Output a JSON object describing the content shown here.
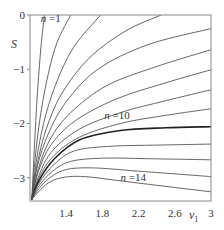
{
  "chart_data": {
    "type": "line",
    "title": "",
    "xlabel": "v1",
    "xlabel_main": "v",
    "xlabel_sub": "1",
    "ylabel": "S",
    "xlim": [
      1.0,
      3.0
    ],
    "ylim": [
      -3.43,
      0
    ],
    "grid": false,
    "legend": "none",
    "x_ticks": [
      1.4,
      1.8,
      2.2,
      2.6,
      3
    ],
    "x_tick_labels": [
      "1.4",
      "1.8",
      "2.2",
      "2.6",
      "3"
    ],
    "y_ticks": [
      0,
      -1,
      -2,
      -3
    ],
    "y_tick_labels": [
      "0",
      "−1",
      "−2",
      "−3"
    ],
    "annotations": [
      {
        "text_n": "n",
        "text_rest": " =1",
        "x": 1.12,
        "y": -0.12
      },
      {
        "text_n": "n",
        "text_rest": " =10",
        "x": 1.82,
        "y": -1.92
      },
      {
        "text_n": "n",
        "text_rest": " =14",
        "x": 2.0,
        "y": -3.07
      }
    ],
    "series": [
      {
        "name": "n=1",
        "x": [
          1.02,
          1.05,
          1.08,
          1.12,
          1.16
        ],
        "y": [
          -3.4,
          -2.4,
          -1.5,
          -0.6,
          0.0
        ]
      },
      {
        "name": "n=2",
        "x": [
          1.02,
          1.06,
          1.12,
          1.2,
          1.3,
          1.45
        ],
        "y": [
          -3.4,
          -2.6,
          -1.8,
          -1.1,
          -0.5,
          0.0
        ]
      },
      {
        "name": "n=3",
        "x": [
          1.02,
          1.07,
          1.15,
          1.28,
          1.48,
          1.78
        ],
        "y": [
          -3.4,
          -2.7,
          -2.0,
          -1.3,
          -0.6,
          0.0
        ]
      },
      {
        "name": "n=4",
        "x": [
          1.02,
          1.08,
          1.18,
          1.35,
          1.65,
          2.05,
          2.45
        ],
        "y": [
          -3.4,
          -2.75,
          -2.1,
          -1.45,
          -0.8,
          -0.3,
          0.0
        ]
      },
      {
        "name": "n=5",
        "x": [
          1.02,
          1.08,
          1.2,
          1.4,
          1.75,
          2.3,
          3.0
        ],
        "y": [
          -3.4,
          -2.8,
          -2.2,
          -1.6,
          -1.0,
          -0.55,
          -0.25
        ]
      },
      {
        "name": "n=6",
        "x": [
          1.02,
          1.09,
          1.22,
          1.45,
          1.85,
          2.4,
          3.0
        ],
        "y": [
          -3.4,
          -2.85,
          -2.3,
          -1.8,
          -1.3,
          -0.95,
          -0.64
        ]
      },
      {
        "name": "n=7",
        "x": [
          1.02,
          1.09,
          1.23,
          1.5,
          1.95,
          2.5,
          3.0
        ],
        "y": [
          -3.4,
          -2.9,
          -2.4,
          -1.95,
          -1.55,
          -1.25,
          -1.01
        ]
      },
      {
        "name": "n=8",
        "x": [
          1.02,
          1.1,
          1.25,
          1.55,
          2.0,
          2.5,
          3.0
        ],
        "y": [
          -3.4,
          -2.95,
          -2.5,
          -2.1,
          -1.8,
          -1.58,
          -1.38
        ]
      },
      {
        "name": "n=9",
        "x": [
          1.02,
          1.1,
          1.26,
          1.55,
          2.0,
          2.5,
          3.0
        ],
        "y": [
          -3.4,
          -3.0,
          -2.6,
          -2.25,
          -2.0,
          -1.85,
          -1.73
        ]
      },
      {
        "name": "n=10",
        "x": [
          1.02,
          1.1,
          1.27,
          1.55,
          2.0,
          2.5,
          3.0
        ],
        "y": [
          -3.4,
          -3.05,
          -2.65,
          -2.3,
          -2.13,
          -2.08,
          -2.06
        ],
        "bold": true
      },
      {
        "name": "n=11",
        "x": [
          1.02,
          1.1,
          1.27,
          1.5,
          1.9,
          2.4,
          3.0
        ],
        "y": [
          -3.4,
          -3.1,
          -2.75,
          -2.5,
          -2.42,
          -2.4,
          -2.38
        ]
      },
      {
        "name": "n=12",
        "x": [
          1.02,
          1.1,
          1.25,
          1.45,
          1.8,
          2.3,
          3.0
        ],
        "y": [
          -3.4,
          -3.15,
          -2.88,
          -2.7,
          -2.64,
          -2.65,
          -2.67
        ]
      },
      {
        "name": "n=13",
        "x": [
          1.02,
          1.1,
          1.22,
          1.4,
          1.7,
          2.2,
          3.0
        ],
        "y": [
          -3.4,
          -3.2,
          -3.0,
          -2.85,
          -2.82,
          -2.88,
          -2.98
        ]
      },
      {
        "name": "n=14",
        "x": [
          1.02,
          1.1,
          1.2,
          1.35,
          1.6,
          2.1,
          3.0
        ],
        "y": [
          -3.4,
          -3.25,
          -3.1,
          -3.0,
          -2.98,
          -3.08,
          -3.26
        ]
      }
    ]
  },
  "style": {
    "frame_color": "#888888",
    "curve_color": "#555555",
    "bold_curve_color": "#222222"
  }
}
